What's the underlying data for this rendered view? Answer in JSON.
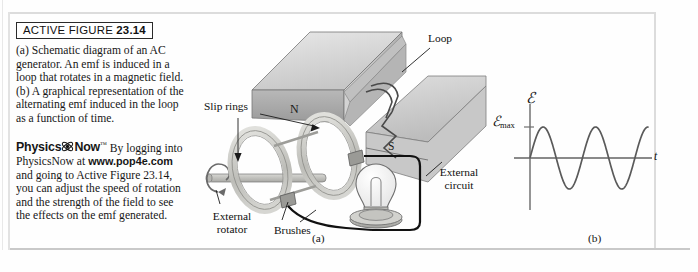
{
  "figure": {
    "header_prefix": "ACTIVE FIGURE ",
    "header_number": "23.14",
    "caption_a": "(a) Schematic diagram of an AC generator. An emf is induced in a loop that rotates in a magnetic field.",
    "caption_b": "(b) A graphical representation of the alternating emf induced in the loop as a function of time.",
    "panel_a_tag": "(a)",
    "panel_b_tag": "(b)"
  },
  "physicsnow": {
    "logo_physics": "Physics",
    "logo_now": "Now",
    "trademark": "™",
    "text_before_url": "By logging into PhysicsNow at ",
    "url": "www.pop4e.com",
    "text_after_url": " and going to Active Figure 23.14, you can adjust the speed of rotation and the strength of the field to see the effects on the emf generated."
  },
  "diagram": {
    "labels": {
      "loop": "Loop",
      "slip_rings": "Slip rings",
      "north_pole": "N",
      "south_pole": "S",
      "external_rotator_line1": "External",
      "external_rotator_line2": "rotator",
      "brushes": "Brushes",
      "external_circuit_line1": "External",
      "external_circuit_line2": "circuit"
    },
    "colors": {
      "magnet_top": "#d8d8d8",
      "magnet_front": "#a8a8a8",
      "magnet_side": "#c2c2c2",
      "ring": "#c8c8c4",
      "wire": "#111111",
      "outline": "#6a6a6a"
    }
  },
  "chart_data": {
    "type": "line",
    "title": "",
    "xlabel": "t",
    "ylabel": "ℰ",
    "ylabel_max": "ℰ",
    "ylabel_max_sub": "max",
    "series": [
      {
        "name": "emf",
        "function": "sine",
        "amplitude": 1,
        "cycles": 2.25,
        "phase": 0,
        "start_at_origin": true
      }
    ],
    "xlim": [
      0,
      2.25
    ],
    "ylim": [
      -1.15,
      1.15
    ],
    "yticks": [
      1
    ],
    "ytick_labels": [
      "ℰmax"
    ],
    "grid": false,
    "legend": false,
    "axis_color": "#8a8a8a",
    "curve_color": "#5a5a5a"
  }
}
